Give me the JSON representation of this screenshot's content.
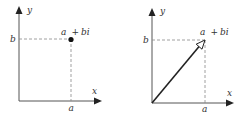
{
  "colors": {
    "axis": "#555555",
    "dash": "#888888",
    "ink": "#222222",
    "background": "#ffffff"
  },
  "diagrams": [
    {
      "id": "point-form",
      "description": "Complex number plotted as a point",
      "axis_x_label": "x",
      "axis_y_label": "y",
      "tick_x_label": "a",
      "tick_y_label": "b",
      "point_label_a": "a",
      "point_label_plus": "+",
      "point_label_bi": "bi",
      "marker": "filled-dot"
    },
    {
      "id": "vector-form",
      "description": "Complex number plotted as a vector from the origin",
      "axis_x_label": "x",
      "axis_y_label": "y",
      "tick_x_label": "a",
      "tick_y_label": "b",
      "point_label_a": "a",
      "point_label_plus": "+",
      "point_label_bi": "bi",
      "marker": "open-arrowhead"
    }
  ]
}
